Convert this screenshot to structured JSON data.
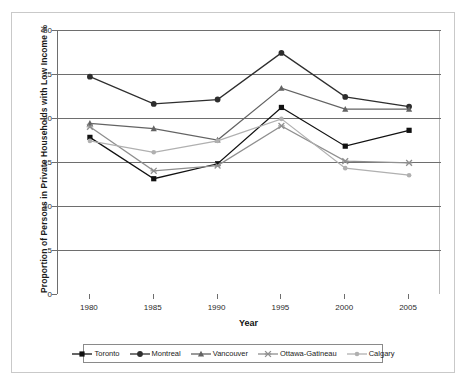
{
  "chart_data": {
    "type": "line",
    "title": "",
    "xlabel": "Year",
    "ylabel": "Proportion of Persons in Private Households with Low Income %",
    "x": [
      1980,
      1985,
      1990,
      1995,
      2000,
      2005
    ],
    "categories": [
      "1980",
      "1985",
      "1990",
      "1995",
      "2000",
      "2005"
    ],
    "xlim": [
      1977.5,
      2007.5
    ],
    "ylim": [
      0,
      30
    ],
    "yticks": [
      0,
      5,
      10,
      15,
      20,
      25,
      30
    ],
    "ytick_labels": [
      "0",
      "5",
      "10",
      "15",
      "20",
      "25",
      "30"
    ],
    "grid": "horizontal",
    "legend_position": "bottom",
    "series": [
      {
        "name": "Toronto",
        "marker": "square",
        "color": "#111111",
        "values": [
          17.8,
          13.1,
          14.8,
          21.2,
          16.8,
          18.6
        ]
      },
      {
        "name": "Montreal",
        "marker": "circle",
        "color": "#2e2e2e",
        "values": [
          24.7,
          21.6,
          22.1,
          27.4,
          22.4,
          21.3
        ]
      },
      {
        "name": "Vancouver",
        "marker": "triangle",
        "color": "#636363",
        "values": [
          19.4,
          18.8,
          17.5,
          23.4,
          21.0,
          21.0
        ]
      },
      {
        "name": "Ottawa-Gatineau",
        "marker": "x",
        "color": "#8f8f8f",
        "values": [
          19.0,
          14.0,
          14.6,
          19.1,
          15.1,
          14.9
        ]
      },
      {
        "name": "Calgary",
        "marker": "circle-small",
        "color": "#b0b0b0",
        "values": [
          17.4,
          16.1,
          17.4,
          19.9,
          14.3,
          13.5
        ]
      }
    ]
  },
  "legend": {
    "items": [
      {
        "label": "Toronto"
      },
      {
        "label": "Montreal"
      },
      {
        "label": "Vancouver"
      },
      {
        "label": "Ottawa-Gatineau"
      },
      {
        "label": "Calgary"
      }
    ]
  },
  "axes": {
    "x_title": "Year",
    "y_title": "Proportion of Persons in Private Households with Low Income %"
  },
  "colors": {
    "grid": "#6e6e6e",
    "axis": "#6e6e6e",
    "frame": "#c9c9c9",
    "text": "#1a1a1a",
    "background": "#ffffff"
  }
}
